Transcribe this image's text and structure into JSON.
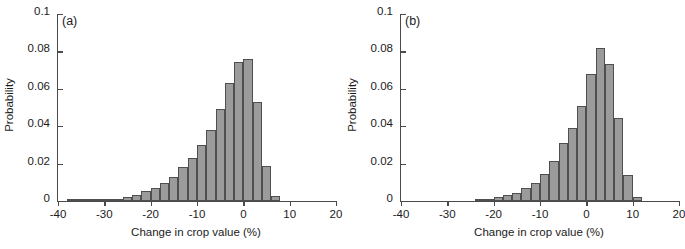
{
  "figure": {
    "width": 685,
    "height": 249,
    "background": "#ffffff",
    "bar_fill": "#9b9b9b",
    "bar_stroke": "#4f4f4f",
    "axis_color": "#4a4a4a"
  },
  "panels": [
    {
      "tag": "(a)",
      "xlabel": "Change in crop value (%)",
      "ylabel": "Probability"
    },
    {
      "tag": "(b)",
      "xlabel": "Change in crop value (%)",
      "ylabel": "Probability"
    }
  ],
  "axes": {
    "x_ticks": [
      "-40",
      "-30",
      "-20",
      "-10",
      "0",
      "10",
      "20"
    ],
    "x_tick_values": [
      -40,
      -30,
      -20,
      -10,
      0,
      10,
      20
    ],
    "y_ticks": [
      "0",
      "0.02",
      "0.04",
      "0.06",
      "0.08",
      "0.1"
    ],
    "y_tick_values": [
      0,
      0.02,
      0.04,
      0.06,
      0.08,
      0.1
    ],
    "xlim": [
      -40,
      20
    ],
    "ylim": [
      0,
      0.1
    ]
  },
  "chart_data": [
    {
      "type": "bar",
      "title": "(a)",
      "xlabel": "Change in crop value (%)",
      "ylabel": "Probability",
      "xlim": [
        -40,
        20
      ],
      "ylim": [
        0,
        0.1
      ],
      "grid": false,
      "legend": null,
      "bin_width": 2,
      "bin_starts": [
        -38,
        -36,
        -34,
        -32,
        -30,
        -28,
        -26,
        -24,
        -22,
        -20,
        -18,
        -16,
        -14,
        -12,
        -10,
        -8,
        -6,
        -4,
        -2,
        0,
        2,
        4,
        6,
        8
      ],
      "categories": [
        "-38",
        "-36",
        "-34",
        "-32",
        "-30",
        "-28",
        "-26",
        "-24",
        "-22",
        "-20",
        "-18",
        "-16",
        "-14",
        "-12",
        "-10",
        "-8",
        "-6",
        "-4",
        "-2",
        "0",
        "2",
        "4",
        "6",
        "8"
      ],
      "values": [
        0.0006,
        0.0007,
        0.0008,
        0.0009,
        0.001,
        0.0012,
        0.0022,
        0.0032,
        0.0056,
        0.007,
        0.0094,
        0.0128,
        0.018,
        0.0232,
        0.03,
        0.038,
        0.049,
        0.063,
        0.0742,
        0.0762,
        0.053,
        0.0185,
        0.0025,
        0.0
      ]
    },
    {
      "type": "bar",
      "title": "(b)",
      "xlabel": "Change in crop value (%)",
      "ylabel": "Probability",
      "xlim": [
        -40,
        20
      ],
      "ylim": [
        0,
        0.1
      ],
      "grid": false,
      "legend": null,
      "bin_width": 2,
      "bin_starts": [
        -24,
        -22,
        -20,
        -18,
        -16,
        -14,
        -12,
        -10,
        -8,
        -6,
        -4,
        -2,
        0,
        2,
        4,
        6,
        8,
        10,
        12,
        14
      ],
      "categories": [
        "-24",
        "-22",
        "-20",
        "-18",
        "-16",
        "-14",
        "-12",
        "-10",
        "-8",
        "-6",
        "-4",
        "-2",
        "0",
        "2",
        "4",
        "6",
        "8",
        "10",
        "12",
        "14"
      ],
      "values": [
        0.0008,
        0.001,
        0.002,
        0.003,
        0.0042,
        0.007,
        0.0098,
        0.0143,
        0.0212,
        0.0308,
        0.0393,
        0.051,
        0.068,
        0.082,
        0.0735,
        0.0443,
        0.0137,
        0.0022,
        0.0,
        0.0
      ]
    }
  ]
}
